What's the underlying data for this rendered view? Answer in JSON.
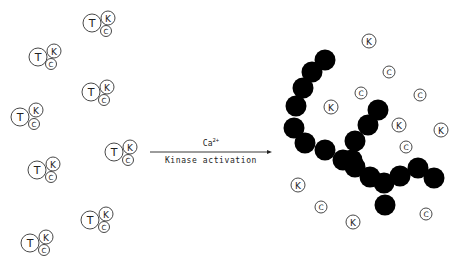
{
  "diagram": {
    "left_side": {
      "complexes": [
        {
          "T": [
            92,
            23
          ],
          "K": [
            108,
            18
          ],
          "C": [
            106,
            31
          ]
        },
        {
          "T": [
            38,
            57
          ],
          "K": [
            54,
            51
          ],
          "C": [
            51,
            64
          ]
        },
        {
          "T": [
            91,
            92
          ],
          "K": [
            107,
            87
          ],
          "C": [
            104,
            100
          ]
        },
        {
          "T": [
            20,
            117
          ],
          "K": [
            36,
            110
          ],
          "C": [
            34,
            124
          ]
        },
        {
          "T": [
            114,
            152
          ],
          "K": [
            130,
            147
          ],
          "C": [
            128,
            160
          ]
        },
        {
          "T": [
            37,
            170
          ],
          "K": [
            53,
            164
          ],
          "C": [
            51,
            177
          ]
        },
        {
          "T": [
            90,
            220
          ],
          "K": [
            106,
            214
          ],
          "C": [
            104,
            227
          ]
        },
        {
          "T": [
            30,
            243
          ],
          "K": [
            46,
            237
          ],
          "C": [
            44,
            250
          ]
        }
      ],
      "labels": {
        "T": "T",
        "K": "K",
        "C": "C"
      }
    },
    "arrow": {
      "x1": 150,
      "x2": 272,
      "y": 152,
      "above_label": "Ca",
      "above_superscript": "2+",
      "below_label": "Kinase activation"
    },
    "right_side": {
      "chain_beads": [
        [
          325,
          60
        ],
        [
          312,
          72
        ],
        [
          303,
          88
        ],
        [
          296,
          106
        ],
        [
          294,
          128
        ],
        [
          305,
          143
        ],
        [
          325,
          150
        ],
        [
          343,
          160
        ],
        [
          355,
          167
        ],
        [
          370,
          177
        ],
        [
          384,
          183
        ],
        [
          385,
          205
        ],
        [
          400,
          176
        ],
        [
          418,
          168
        ],
        [
          434,
          178
        ],
        [
          378,
          110
        ],
        [
          368,
          125
        ],
        [
          355,
          141
        ],
        [
          352,
          160
        ]
      ],
      "free_particles": [
        {
          "label": "K",
          "pos": [
            369,
            41
          ]
        },
        {
          "label": "C",
          "pos": [
            389,
            72
          ]
        },
        {
          "label": "C",
          "pos": [
            361,
            93
          ]
        },
        {
          "label": "K",
          "pos": [
            331,
            107
          ]
        },
        {
          "label": "C",
          "pos": [
            420,
            95
          ]
        },
        {
          "label": "K",
          "pos": [
            399,
            125
          ]
        },
        {
          "label": "K",
          "pos": [
            441,
            130
          ]
        },
        {
          "label": "C",
          "pos": [
            406,
            147
          ]
        },
        {
          "label": "K",
          "pos": [
            298,
            185
          ]
        },
        {
          "label": "C",
          "pos": [
            321,
            207
          ]
        },
        {
          "label": "K",
          "pos": [
            353,
            222
          ]
        },
        {
          "label": "C",
          "pos": [
            426,
            214
          ]
        }
      ]
    },
    "colors": {
      "bead": "#000000",
      "stroke": "#333333",
      "background": "#ffffff"
    }
  }
}
